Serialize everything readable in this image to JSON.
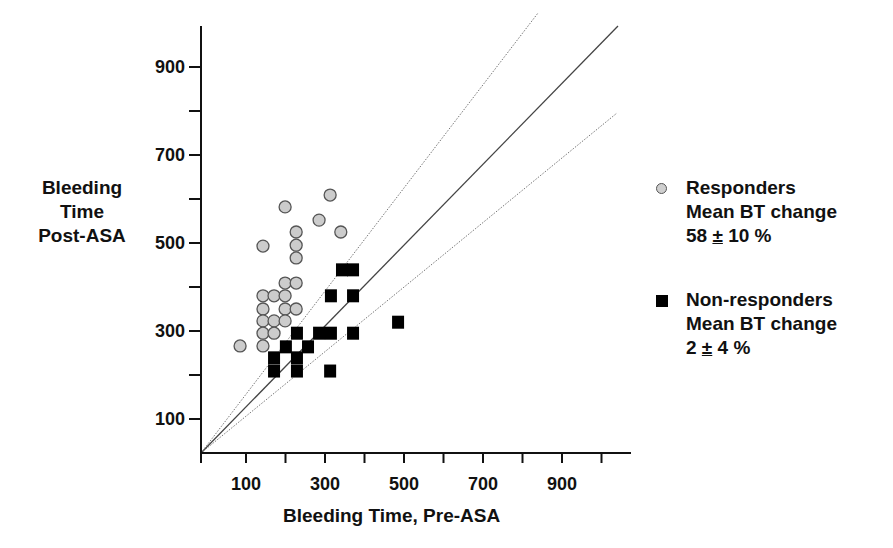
{
  "chart_data": {
    "type": "scatter",
    "title": "",
    "xlabel": "Bleeding Time, Pre-ASA",
    "ylabel": [
      "Bleeding",
      "Time",
      "Post-ASA"
    ],
    "xlim": [
      0,
      1050
    ],
    "ylim": [
      20,
      990
    ],
    "x_ticks": [
      100,
      200,
      300,
      400,
      500,
      600,
      700,
      800,
      900,
      1000
    ],
    "x_tick_labels": [
      "100",
      "300",
      "500",
      "700",
      "900"
    ],
    "y_ticks": [
      100,
      200,
      300,
      400,
      500,
      600,
      700,
      800,
      900
    ],
    "y_tick_labels": [
      "100",
      "300",
      "500",
      "700",
      "900"
    ],
    "grid": false,
    "legend_position": "right",
    "reference_lines": [
      {
        "name": "identity",
        "slope": 1.0,
        "style": "solid"
      },
      {
        "name": "upper",
        "slope": 1.2,
        "style": "dotted"
      },
      {
        "name": "lower",
        "slope": 0.8,
        "style": "dotted"
      }
    ],
    "series": [
      {
        "name": "Responders",
        "marker": "circle",
        "color": "#cccccc",
        "points": [
          [
            313,
            609
          ],
          [
            199,
            582
          ],
          [
            285,
            552
          ],
          [
            340,
            525
          ],
          [
            227,
            525
          ],
          [
            143,
            493
          ],
          [
            227,
            495
          ],
          [
            227,
            466
          ],
          [
            199,
            409
          ],
          [
            227,
            409
          ],
          [
            143,
            380
          ],
          [
            171,
            380
          ],
          [
            199,
            380
          ],
          [
            143,
            350
          ],
          [
            199,
            350
          ],
          [
            227,
            350
          ],
          [
            143,
            323
          ],
          [
            171,
            323
          ],
          [
            199,
            323
          ],
          [
            143,
            295
          ],
          [
            171,
            295
          ],
          [
            85,
            266
          ],
          [
            143,
            266
          ]
        ]
      },
      {
        "name": "Non-responders",
        "marker": "square",
        "color": "#000000",
        "points": [
          [
            343,
            439
          ],
          [
            371,
            439
          ],
          [
            315,
            380
          ],
          [
            371,
            380
          ],
          [
            485,
            320
          ],
          [
            229,
            295
          ],
          [
            285,
            295
          ],
          [
            315,
            295
          ],
          [
            371,
            295
          ],
          [
            201,
            264
          ],
          [
            257,
            264
          ],
          [
            171,
            239
          ],
          [
            171,
            209
          ],
          [
            229,
            239
          ],
          [
            229,
            209
          ],
          [
            313,
            209
          ]
        ]
      }
    ]
  },
  "axis": {
    "xlabel": "Bleeding Time, Pre-ASA",
    "ylabel_line1": "Bleeding",
    "ylabel_line2": "Time",
    "ylabel_line3": "Post-ASA"
  },
  "legend": {
    "responders": {
      "line1": "Responders",
      "line2": "Mean BT change",
      "value": "58",
      "pm": "±",
      "err": "10 %"
    },
    "nonresponders": {
      "line1": "Non-responders",
      "line2": "Mean BT change",
      "value": "2",
      "pm": "±",
      "err": "4 %"
    }
  }
}
